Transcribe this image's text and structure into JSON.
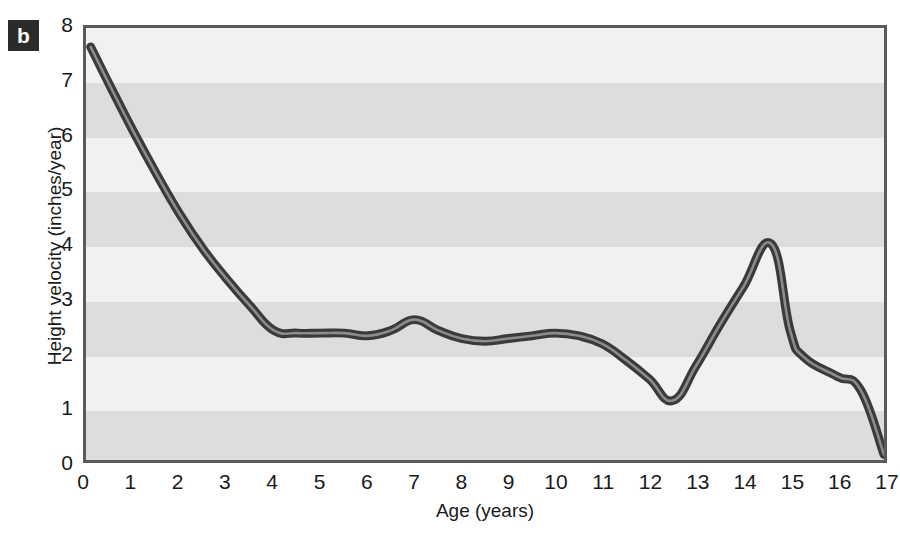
{
  "panel": {
    "letter": "b"
  },
  "chart_data": {
    "type": "line",
    "title": "",
    "xlabel": "Age  (years)",
    "ylabel": "Height velocity (inches/year)",
    "xlim": [
      0,
      17
    ],
    "ylim": [
      0,
      8
    ],
    "xticks": [
      "0",
      "1",
      "2",
      "3",
      "4",
      "5",
      "6",
      "7",
      "8",
      "9",
      "10",
      "11",
      "12",
      "13",
      "14",
      "15",
      "16",
      "17"
    ],
    "yticks": [
      "0",
      "1",
      "2",
      "3",
      "4",
      "5",
      "6",
      "7",
      "8"
    ],
    "grid": "horizontal alternating shaded bands, one per 1 inch/year",
    "legend": "none",
    "series": [
      {
        "name": "Height velocity",
        "color": "#3a3a3a",
        "x": [
          0.1,
          0.5,
          1.0,
          1.5,
          2.0,
          2.5,
          3.0,
          3.5,
          4.0,
          4.5,
          5.0,
          5.5,
          6.0,
          6.5,
          7.0,
          7.5,
          8.0,
          8.5,
          9.0,
          9.5,
          10.0,
          10.5,
          11.0,
          11.5,
          12.0,
          12.5,
          13.0,
          13.5,
          14.0,
          14.6,
          15.0,
          15.3,
          16.0,
          16.5,
          17.0
        ],
        "y": [
          7.65,
          6.95,
          6.1,
          5.3,
          4.55,
          3.9,
          3.35,
          2.85,
          2.4,
          2.35,
          2.35,
          2.35,
          2.3,
          2.4,
          2.6,
          2.4,
          2.25,
          2.2,
          2.25,
          2.3,
          2.35,
          2.3,
          2.15,
          1.85,
          1.5,
          1.1,
          1.75,
          2.5,
          3.2,
          4.0,
          2.4,
          1.9,
          1.55,
          1.3,
          0.1
        ]
      }
    ],
    "bands": [
      {
        "from": 7,
        "to": 8,
        "shade": "light"
      },
      {
        "from": 6,
        "to": 7,
        "shade": "dark"
      },
      {
        "from": 5,
        "to": 6,
        "shade": "light"
      },
      {
        "from": 4,
        "to": 5,
        "shade": "dark"
      },
      {
        "from": 3,
        "to": 4,
        "shade": "light"
      },
      {
        "from": 2,
        "to": 3,
        "shade": "dark"
      },
      {
        "from": 1,
        "to": 2,
        "shade": "light"
      },
      {
        "from": 0,
        "to": 1,
        "shade": "dark"
      }
    ],
    "colors": {
      "band_light": "#f1f1f1",
      "band_dark": "#dddddd",
      "line": "#3a3a3a",
      "line_highlight": "#8c8c8c",
      "frame": "#5a5a5a",
      "text": "#1a1a1a",
      "badge_bg": "#2b2b2b",
      "badge_text": "#ffffff"
    }
  }
}
